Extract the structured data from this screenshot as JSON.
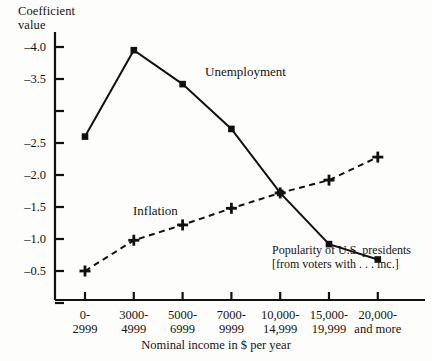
{
  "chart_data": {
    "type": "line",
    "title": "",
    "ylabel": "Coefficient\nvalue",
    "xlabel": "Nominal income in $ per year",
    "categories": [
      "0-\n2999",
      "3000-\n4999",
      "5000-\n6999",
      "7000-\n9999",
      "10,000-\n14,999",
      "15,000-\n19,999",
      "20,000-\nand more"
    ],
    "ytick_labels": [
      "-4.0",
      "-3.5",
      "-2.5",
      "-2.0",
      "-1.5",
      "-1.0",
      "-0.5"
    ],
    "ytick_values": [
      -4.0,
      -3.5,
      -3.0,
      -2.5,
      -2.0,
      -1.5,
      -1.0,
      -0.5
    ],
    "ylim": [
      -4.25,
      -0.25
    ],
    "y_axis_inverted": true,
    "grid": false,
    "legend": "inline-labels",
    "series": [
      {
        "name": "Unemployment",
        "linestyle": "solid",
        "marker": "filled-square",
        "values": [
          -2.6,
          -3.95,
          -3.42,
          -2.72,
          -1.72,
          -0.92,
          -0.68
        ]
      },
      {
        "name": "Inflation",
        "linestyle": "dashed",
        "marker": "plus",
        "values": [
          -0.5,
          -0.98,
          -1.22,
          -1.48,
          -1.72,
          -1.92,
          -2.28
        ]
      }
    ],
    "annotation": "Popularity of U.S. presidents\n[from voters with . . . inc.]",
    "colors": {
      "line": "#111111",
      "text": "#15130f",
      "background": "#fdfdfb"
    }
  }
}
